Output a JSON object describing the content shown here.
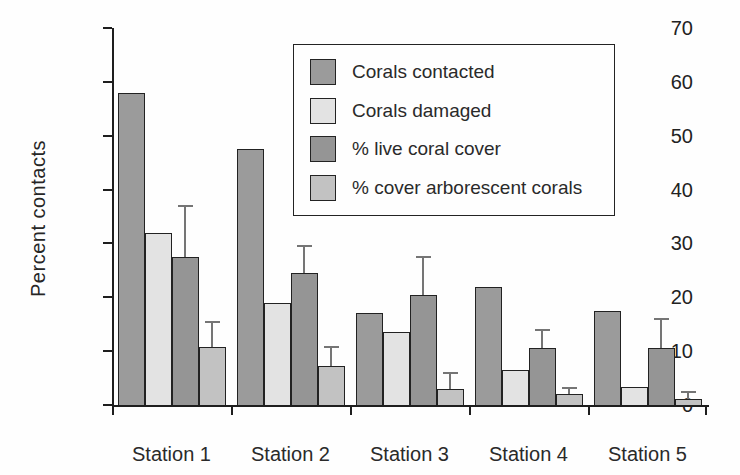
{
  "chart_data": {
    "type": "bar",
    "title": "",
    "xlabel": "",
    "ylabel": "Percent contacts",
    "ylim": [
      0,
      70
    ],
    "yticks": [
      0,
      10,
      20,
      30,
      40,
      50,
      60,
      70
    ],
    "grid": false,
    "legend_position": "upper-right-inside",
    "categories": [
      "Station 1",
      "Station 2",
      "Station 3",
      "Station 4",
      "Station 5"
    ],
    "series": [
      {
        "name": "Corals contacted",
        "color": "#9b9b9b",
        "values": [
          58,
          47.5,
          17,
          22,
          17.5
        ],
        "errors": null
      },
      {
        "name": "Corals damaged",
        "color": "#e3e3e3",
        "values": [
          32,
          19,
          13.5,
          6.5,
          3.3
        ],
        "errors": null
      },
      {
        "name": "% live coral cover",
        "color": "#959595",
        "values": [
          27.5,
          24.5,
          20.5,
          10.5,
          10.5
        ],
        "errors": [
          9.5,
          5,
          7,
          3.5,
          5.5
        ]
      },
      {
        "name": "% cover arborescent corals",
        "color": "#c2c2c2",
        "values": [
          10.7,
          7.2,
          3,
          2,
          1.2
        ],
        "errors": [
          4.8,
          3.5,
          3,
          1.2,
          1.3
        ]
      }
    ]
  }
}
